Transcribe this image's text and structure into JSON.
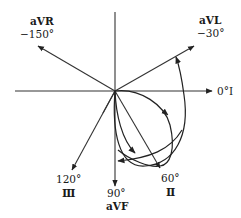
{
  "diagram": {
    "center": {
      "x": 115,
      "y": 91
    },
    "colors": {
      "line": "#333333",
      "text": "#1a1a1a",
      "background": "#ffffff"
    },
    "leads": [
      {
        "name": "aVR",
        "angle": "−150°",
        "lead_label": "aVR",
        "angle_label": "−150°"
      },
      {
        "name": "aVL",
        "angle": "−30°",
        "lead_label": "aVL",
        "angle_label": "−30°"
      },
      {
        "name": "I",
        "angle": "0°",
        "lead_label": "I",
        "angle_label": "0°"
      },
      {
        "name": "II",
        "angle": "60°",
        "lead_label": "Ⅱ",
        "angle_label": "60°"
      },
      {
        "name": "aVF",
        "angle": "90°",
        "lead_label": "aVF",
        "angle_label": "90°"
      },
      {
        "name": "III",
        "angle": "120°",
        "lead_label": "Ⅲ",
        "angle_label": "120°"
      }
    ],
    "labels": {
      "avr": {
        "name": "aVR",
        "angle": "−150°"
      },
      "avl": {
        "name": "aVL",
        "angle": "−30°"
      },
      "lead1": {
        "text": "0°Ⅰ"
      },
      "lead2": {
        "angle": "60°",
        "name": "Ⅱ"
      },
      "avf": {
        "angle": "90°",
        "name": "aVF"
      },
      "lead3": {
        "angle": "120°",
        "name": "Ⅲ"
      }
    },
    "loops": [
      {
        "name": "large-loop-to-aVL",
        "direction": "counterclockwise"
      },
      {
        "name": "ellipse-loop-lead-II",
        "direction": "clockwise"
      },
      {
        "name": "inner-loop-to-aVF",
        "direction": "clockwise"
      }
    ]
  }
}
